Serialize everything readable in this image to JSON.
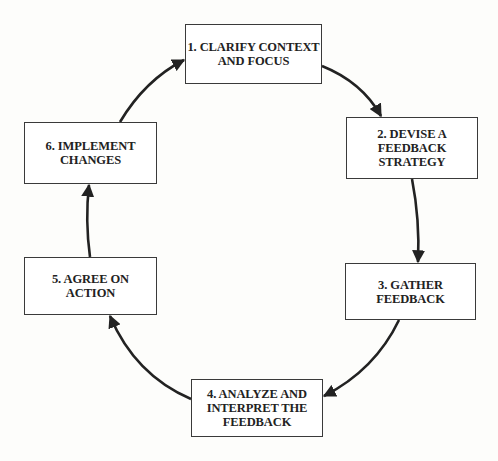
{
  "diagram": {
    "type": "cycle",
    "steps": [
      {
        "number": 1,
        "label": "1. CLARIFY CONTEXT\nAND FOCUS"
      },
      {
        "number": 2,
        "label": "2. DEVISE A\nFEEDBACK\nSTRATEGY"
      },
      {
        "number": 3,
        "label": "3. GATHER\nFEEDBACK"
      },
      {
        "number": 4,
        "label": "4. ANALYZE AND\nINTERPRET THE\nFEEDBACK"
      },
      {
        "number": 5,
        "label": "5. AGREE ON\nACTION"
      },
      {
        "number": 6,
        "label": "6. IMPLEMENT\nCHANGES"
      }
    ],
    "edges": [
      {
        "from": 1,
        "to": 2
      },
      {
        "from": 2,
        "to": 3
      },
      {
        "from": 3,
        "to": 4
      },
      {
        "from": 4,
        "to": 5
      },
      {
        "from": 5,
        "to": 6
      },
      {
        "from": 6,
        "to": 1
      }
    ],
    "colors": {
      "stroke": "#222222",
      "box_fill": "#ffffff",
      "background": "#fdfdfb"
    }
  }
}
